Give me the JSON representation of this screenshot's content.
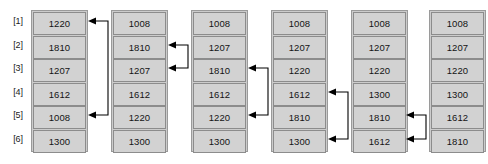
{
  "diagram": {
    "row_indices": [
      "[1]",
      "[2]",
      "[3]",
      "[4]",
      "[5]",
      "[6]"
    ],
    "box_fill_color": "#d2d2d2",
    "box_border_color": "#8c8c8c",
    "frame_color": "#cccccc",
    "arrow_color": "#000000",
    "columns": [
      {
        "name": "pass-0-initial",
        "values": [
          "1220",
          "1810",
          "1207",
          "1612",
          "1008",
          "1300"
        ]
      },
      {
        "name": "pass-1",
        "values": [
          "1008",
          "1810",
          "1207",
          "1612",
          "1220",
          "1300"
        ]
      },
      {
        "name": "pass-2",
        "values": [
          "1008",
          "1207",
          "1810",
          "1612",
          "1220",
          "1300"
        ]
      },
      {
        "name": "pass-3",
        "values": [
          "1008",
          "1207",
          "1220",
          "1612",
          "1810",
          "1300"
        ]
      },
      {
        "name": "pass-4",
        "values": [
          "1008",
          "1207",
          "1220",
          "1300",
          "1810",
          "1612"
        ]
      },
      {
        "name": "pass-5-sorted",
        "values": [
          "1008",
          "1207",
          "1220",
          "1300",
          "1612",
          "1810"
        ]
      }
    ],
    "swaps": [
      {
        "name": "swap-1-5",
        "after_column": 1,
        "from_row": 1,
        "to_row": 5
      },
      {
        "name": "swap-2-3",
        "after_column": 2,
        "from_row": 2,
        "to_row": 3
      },
      {
        "name": "swap-3-5",
        "after_column": 3,
        "from_row": 3,
        "to_row": 5
      },
      {
        "name": "swap-4-6",
        "after_column": 4,
        "from_row": 4,
        "to_row": 6
      },
      {
        "name": "swap-5-6",
        "after_column": 5,
        "from_row": 5,
        "to_row": 6
      }
    ]
  }
}
